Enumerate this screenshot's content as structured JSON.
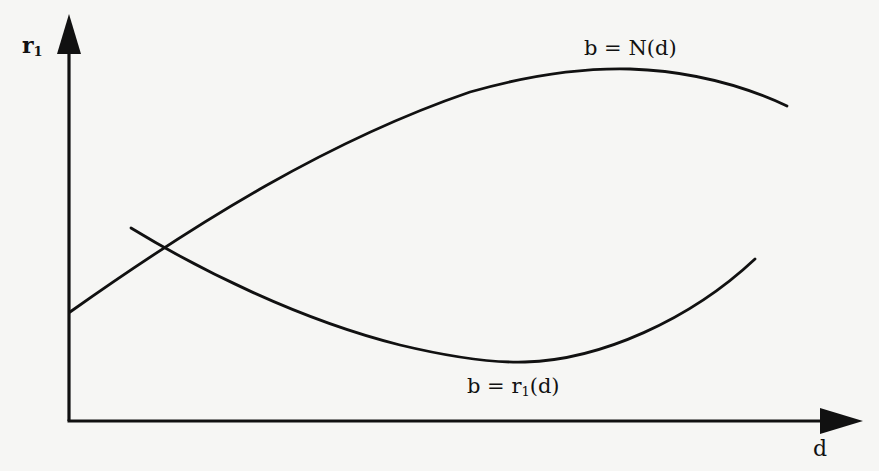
{
  "diagram": {
    "type": "function-curves",
    "axes": {
      "y_label_base": "r",
      "y_label_sub": "1",
      "x_label": "d"
    },
    "curves": [
      {
        "id": "N",
        "label_lhs": "b = N(",
        "label_arg": "d",
        "label_rhs": ")",
        "label": "b = N(d)",
        "shape": "concave, rising from y-axis to a maximum then falling"
      },
      {
        "id": "r1",
        "label_prefix": "b = r",
        "label_sub": "1",
        "label_suffix": "(d)",
        "label": "b = r1(d)",
        "shape": "convex, falling to a minimum then rising"
      }
    ],
    "colors": {
      "ink": "#111111",
      "paper": "#f6f6f4"
    }
  }
}
